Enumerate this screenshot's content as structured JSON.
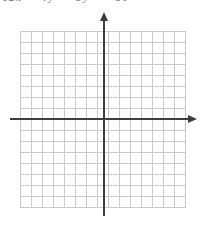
{
  "header": {
    "equation_text_clipped": "12x - 4y + 3y = -36"
  },
  "graph": {
    "grid": {
      "columns": 15,
      "rows": 16,
      "cell_size_px": 11,
      "plotted_series": []
    },
    "axes": {
      "x_axis": "x-axis",
      "y_axis": "y-axis",
      "tick_labels": [],
      "axis_text_labels": []
    }
  },
  "colors": {
    "background": "#ffffff",
    "grid_line": "#c9c9c9",
    "axis": "#3d3d3d",
    "text": "#6a6a6a"
  }
}
